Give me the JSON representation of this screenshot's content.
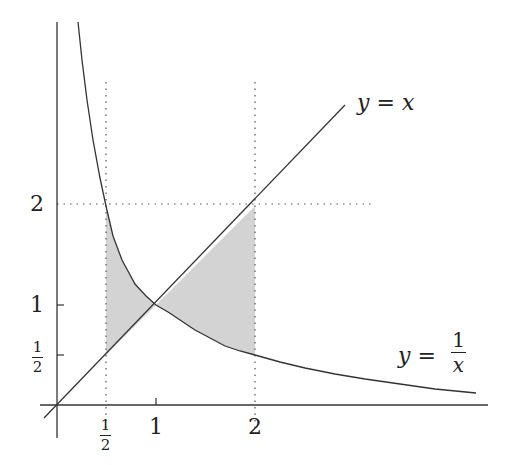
{
  "diagram": {
    "colors": {
      "axis": "#333333",
      "curve": "#333333",
      "shade": "#d3d3d3",
      "dotted": "#555555"
    },
    "x_ticks": [
      {
        "num": "1",
        "den": "2",
        "value": 0.5
      },
      {
        "label": "1",
        "value": 1
      },
      {
        "label": "2",
        "value": 2
      }
    ],
    "y_ticks": [
      {
        "num": "1",
        "den": "2",
        "value": 0.5
      },
      {
        "label": "1",
        "value": 1
      },
      {
        "label": "2",
        "value": 2
      }
    ],
    "labels": {
      "line": {
        "lhs": "y",
        "eq": "=",
        "rhs": "x"
      },
      "hyperbola": {
        "lhs": "y",
        "eq": "=",
        "num": "1",
        "den": "x"
      }
    },
    "curves": [
      "y = x",
      "y = 1/x"
    ],
    "shaded_regions": [
      "between y=1/x and y=x for 1/2 ≤ x ≤ 1",
      "between y=x and y=1/x for 1 ≤ x ≤ 2"
    ]
  }
}
